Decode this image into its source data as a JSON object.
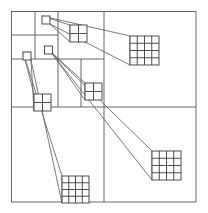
{
  "figure": {
    "type": "diagram",
    "width": 208,
    "height": 213,
    "background_color": "#ffffff",
    "line_color": "#555555",
    "detail_line_color": "#3a3a3a",
    "cone_line_color": "#6b6b6b",
    "stroke_width": 0.9
  },
  "root_square": {
    "name": "quadtree-root",
    "x": 11.5,
    "y": 11.5,
    "width": 184.5,
    "height": 190.5
  },
  "grid_lines": [
    {
      "name": "root-vertical-midline",
      "x1": 104,
      "y1": 11.5,
      "x2": 104,
      "y2": 202
    },
    {
      "name": "root-horizontal-midline",
      "x1": 11.5,
      "y1": 107,
      "x2": 196,
      "y2": 107
    },
    {
      "name": "nw-vertical-quarter",
      "x1": 58,
      "y1": 11.5,
      "x2": 58,
      "y2": 107
    },
    {
      "name": "nw-horizontal-quarter",
      "x1": 11.5,
      "y1": 59,
      "x2": 104,
      "y2": 59
    },
    {
      "name": "nw-nw-horizontal-eighth",
      "x1": 11.5,
      "y1": 35,
      "x2": 58,
      "y2": 35
    },
    {
      "name": "nw-nw-vertical-eighth",
      "x1": 35,
      "y1": 11.5,
      "x2": 35,
      "y2": 59
    },
    {
      "name": "nw-se-vertical-eighth",
      "x1": 81,
      "y1": 59,
      "x2": 81,
      "y2": 107
    },
    {
      "name": "ne-top-right-none",
      "x1": 104,
      "y1": 59,
      "x2": 104,
      "y2": 59
    }
  ],
  "source_cells": [
    {
      "name": "source-cell-1",
      "x": 42,
      "y": 16,
      "size": 8
    },
    {
      "name": "source-cell-2",
      "x": 44.5,
      "y": 46,
      "size": 8
    },
    {
      "name": "source-cell-3",
      "x": 23,
      "y": 52,
      "size": 8
    }
  ],
  "magnified_cells": [
    {
      "name": "magnified-cell-2x2-top",
      "x": 70,
      "y": 25,
      "size": 17,
      "divisions": 2
    },
    {
      "name": "magnified-cell-4x4-top-right",
      "x": 130,
      "y": 36,
      "size": 29,
      "divisions": 4
    },
    {
      "name": "magnified-cell-2x2-left",
      "x": 34,
      "y": 94,
      "size": 17,
      "divisions": 2
    },
    {
      "name": "magnified-cell-2x2-center",
      "x": 85,
      "y": 83,
      "size": 17,
      "divisions": 2
    },
    {
      "name": "magnified-cell-4x4-bottom-right",
      "x": 152,
      "y": 151,
      "size": 29,
      "divisions": 4
    },
    {
      "name": "magnified-cell-4x4-bottom-left",
      "x": 62,
      "y": 176,
      "size": 27,
      "divisions": 4
    }
  ],
  "magnification_cones": [
    {
      "name": "cone-source1-to-2x2-top",
      "points": "42,16 70,25 70,42 50,24"
    },
    {
      "name": "cone-source1-to-4x4-top-right",
      "points": "42,16 130,36 130,65 50,24"
    },
    {
      "name": "cone-source2-to-2x2-center",
      "points": "44.5,46 85,83 85,100 52.5,54"
    },
    {
      "name": "cone-source2-to-4x4-bottom-right",
      "points": "44.5,46 152,151 152,180 52.5,54"
    },
    {
      "name": "cone-source3-to-2x2-left",
      "points": "23,52 34,94 34,111 31,60"
    },
    {
      "name": "cone-source3-to-4x4-bottom-left",
      "points": "23,52 62,176 62,203 31,60"
    }
  ],
  "labels": {
    "alt_text": "Quadtree subdivision of a square region with three small leaf cells, each connected by magnification cones to enlarged 2x2 and 4x4 grid insets."
  }
}
